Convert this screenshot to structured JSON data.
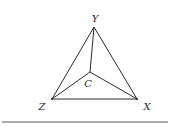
{
  "diagram": {
    "type": "triangle-with-interior-point",
    "colors": {
      "line": "#2b2b2b",
      "rule": "#8c8c8c",
      "text": "#2a2a2a",
      "background": "#ffffff"
    },
    "points": {
      "Y": {
        "label": "Y",
        "x": 94,
        "y": 27,
        "label_x": 95,
        "label_y": 19
      },
      "Z": {
        "label": "Z",
        "x": 52,
        "y": 99,
        "label_x": 42,
        "label_y": 107
      },
      "X": {
        "label": "X",
        "x": 137,
        "y": 99,
        "label_x": 147,
        "label_y": 107
      },
      "C": {
        "label": "C",
        "x": 90,
        "y": 72,
        "label_x": 88,
        "label_y": 84
      }
    },
    "edges": [
      [
        "Y",
        "Z"
      ],
      [
        "Z",
        "X"
      ],
      [
        "X",
        "Y"
      ],
      [
        "C",
        "Y"
      ],
      [
        "C",
        "Z"
      ],
      [
        "C",
        "X"
      ]
    ],
    "rule": {
      "x1": 2,
      "x2": 168,
      "y": 122
    }
  }
}
